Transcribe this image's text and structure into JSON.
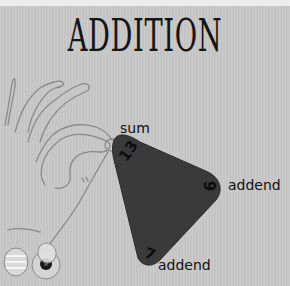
{
  "title": "ADDITION",
  "diagram": {
    "type": "fact-triangle",
    "operation": "addition",
    "corners": [
      {
        "position": "top",
        "value": "13",
        "label": "sum"
      },
      {
        "position": "right",
        "value": "6",
        "label": "addend"
      },
      {
        "position": "bottom",
        "value": "7",
        "label": "addend"
      }
    ],
    "triangle_color": "#3a3a3a",
    "background_color": "#c8c8c8"
  }
}
